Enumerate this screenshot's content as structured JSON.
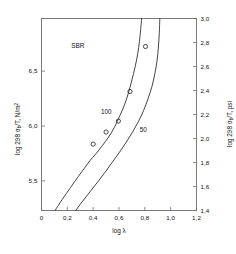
{
  "chart_data": {
    "type": "line",
    "title": "",
    "annotation_material": "SBR",
    "xlabel": "log λ",
    "ylabel_left": "log 298 σb/T, N/m2",
    "ylabel_right": "log 298 σb/T, psi",
    "xlim": [
      0,
      1.2
    ],
    "xticks": [
      0,
      0.2,
      0.4,
      0.6,
      0.8,
      1.0,
      1.2
    ],
    "xticklabels": [
      "0",
      "0,2",
      "0,4",
      "0,6",
      "0,8",
      "1,0",
      "1,2"
    ],
    "ylim_left": [
      5.23,
      6.98
    ],
    "yticks_left": [
      5.5,
      6.0,
      6.5
    ],
    "yticklabels_left": [
      "5,5",
      "6,0",
      "6,5"
    ],
    "ylim_right": [
      1.4,
      3.0
    ],
    "yticks_right": [
      1.4,
      1.6,
      1.8,
      2.0,
      2.2,
      2.4,
      2.6,
      2.8,
      3.0
    ],
    "yticklabels_right": [
      "1,4",
      "1,6",
      "1,8",
      "2,0",
      "2,2",
      "2,4",
      "2,6",
      "2,8",
      "3,0"
    ],
    "grid": false,
    "legend": "inline-curve-labels",
    "series": [
      {
        "name": "100",
        "label": "100",
        "label_x": 0.46,
        "label_y": 6.13,
        "points_x": [
          0.105,
          0.16,
          0.225,
          0.285,
          0.335,
          0.375,
          0.42,
          0.47,
          0.52,
          0.565,
          0.605,
          0.645,
          0.675,
          0.7,
          0.725,
          0.745,
          0.758,
          0.768,
          0.775
        ],
        "points_y": [
          5.23,
          5.33,
          5.44,
          5.54,
          5.62,
          5.685,
          5.745,
          5.82,
          5.9,
          5.99,
          6.09,
          6.2,
          6.31,
          6.42,
          6.54,
          6.66,
          6.77,
          6.88,
          6.98
        ]
      },
      {
        "name": "50",
        "label": "50",
        "label_x": 0.76,
        "label_y": 5.96,
        "points_x": [
          0.265,
          0.315,
          0.375,
          0.435,
          0.49,
          0.545,
          0.6,
          0.655,
          0.705,
          0.75,
          0.79,
          0.825,
          0.855,
          0.878,
          0.895,
          0.905,
          0.912,
          0.916
        ],
        "points_y": [
          5.23,
          5.31,
          5.4,
          5.49,
          5.575,
          5.665,
          5.755,
          5.85,
          5.945,
          6.04,
          6.14,
          6.25,
          6.36,
          6.48,
          6.6,
          6.72,
          6.85,
          6.98
        ]
      }
    ],
    "data_points": [
      {
        "x": 0.4,
        "y": 5.835
      },
      {
        "x": 0.5,
        "y": 5.945
      },
      {
        "x": 0.595,
        "y": 6.045
      },
      {
        "x": 0.685,
        "y": 6.315
      },
      {
        "x": 0.805,
        "y": 6.725
      }
    ],
    "marker": "open-circle"
  }
}
